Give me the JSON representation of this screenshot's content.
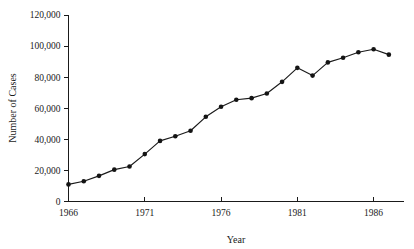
{
  "chart_data": {
    "type": "line",
    "title": "",
    "xlabel": "Year",
    "ylabel": "Number of Cases",
    "xlim": [
      1966,
      1987.5
    ],
    "ylim": [
      0,
      120000
    ],
    "grid": false,
    "legend": null,
    "marker": "filled-circle",
    "line_color": "#1a1a1a",
    "marker_color": "#141414",
    "background_color": "#ffffff",
    "xticks": [
      1966,
      1971,
      1976,
      1981,
      1986
    ],
    "xtick_labels": [
      "1966",
      "1971",
      "1976",
      "1981",
      "1986"
    ],
    "yticks": [
      0,
      20000,
      40000,
      60000,
      80000,
      100000,
      120000
    ],
    "ytick_labels": [
      "0",
      "20,000",
      "40,000",
      "60,000",
      "80,000",
      "100,000",
      "120,000"
    ],
    "x": [
      1966,
      1967,
      1968,
      1969,
      1970,
      1971,
      1972,
      1973,
      1974,
      1975,
      1976,
      1977,
      1978,
      1979,
      1980,
      1981,
      1982,
      1983,
      1984,
      1985,
      1986,
      1987
    ],
    "values": [
      11000,
      13000,
      16500,
      20500,
      22500,
      30500,
      39000,
      42000,
      45500,
      54500,
      61000,
      65500,
      66500,
      69500,
      77000,
      86000,
      81000,
      89500,
      92500,
      96000,
      98000,
      94500
    ],
    "series": [
      {
        "name": "Number of Cases",
        "values": [
          11000,
          13000,
          16500,
          20500,
          22500,
          30500,
          39000,
          42000,
          45500,
          54500,
          61000,
          65500,
          66500,
          69500,
          77000,
          86000,
          81000,
          89500,
          92500,
          96000,
          98000,
          94500
        ]
      }
    ]
  }
}
